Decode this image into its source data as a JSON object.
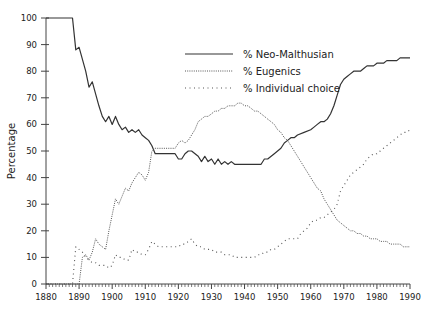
{
  "chart_data": {
    "type": "line",
    "title": "",
    "xlabel": "",
    "ylabel": "Percentage",
    "xlim": [
      1880,
      1990
    ],
    "ylim": [
      0,
      100
    ],
    "grid": false,
    "legend_position": "upper center",
    "x_ticks": [
      "1880",
      "1890",
      "1900",
      "1910",
      "1920",
      "1930",
      "1940",
      "1950",
      "1960",
      "1970",
      "1980",
      "1990"
    ],
    "y_ticks": [
      "0",
      "10",
      "20",
      "30",
      "40",
      "50",
      "60",
      "70",
      "80",
      "90",
      "100"
    ],
    "series": [
      {
        "name": "% Neo-Malthusian",
        "style": "solid",
        "points": [
          [
            1880,
            100
          ],
          [
            1888,
            100
          ],
          [
            1889,
            88
          ],
          [
            1890,
            89
          ],
          [
            1892,
            80
          ],
          [
            1893,
            74
          ],
          [
            1894,
            76
          ],
          [
            1896,
            67
          ],
          [
            1897,
            63
          ],
          [
            1898,
            61
          ],
          [
            1899,
            63
          ],
          [
            1900,
            60
          ],
          [
            1901,
            63
          ],
          [
            1902,
            60
          ],
          [
            1903,
            58
          ],
          [
            1904,
            59
          ],
          [
            1905,
            57
          ],
          [
            1906,
            58
          ],
          [
            1907,
            57
          ],
          [
            1908,
            58
          ],
          [
            1909,
            56
          ],
          [
            1910,
            55
          ],
          [
            1911,
            54
          ],
          [
            1912,
            52
          ],
          [
            1913,
            49
          ],
          [
            1914,
            49
          ],
          [
            1919,
            49
          ],
          [
            1920,
            47
          ],
          [
            1921,
            47
          ],
          [
            1922,
            49
          ],
          [
            1923,
            50
          ],
          [
            1924,
            50
          ],
          [
            1926,
            48
          ],
          [
            1927,
            46
          ],
          [
            1928,
            48
          ],
          [
            1929,
            46
          ],
          [
            1930,
            47
          ],
          [
            1931,
            45
          ],
          [
            1932,
            47
          ],
          [
            1933,
            45
          ],
          [
            1934,
            46
          ],
          [
            1935,
            45
          ],
          [
            1936,
            46
          ],
          [
            1937,
            45
          ],
          [
            1945,
            45
          ],
          [
            1946,
            47
          ],
          [
            1947,
            47
          ],
          [
            1949,
            49
          ],
          [
            1950,
            50
          ],
          [
            1951,
            51
          ],
          [
            1952,
            53
          ],
          [
            1953,
            54
          ],
          [
            1954,
            55
          ],
          [
            1955,
            55
          ],
          [
            1956,
            56
          ],
          [
            1958,
            57
          ],
          [
            1960,
            58
          ],
          [
            1961,
            59
          ],
          [
            1962,
            60
          ],
          [
            1963,
            61
          ],
          [
            1964,
            61
          ],
          [
            1965,
            62
          ],
          [
            1966,
            64
          ],
          [
            1967,
            67
          ],
          [
            1968,
            71
          ],
          [
            1969,
            75
          ],
          [
            1970,
            77
          ],
          [
            1971,
            78
          ],
          [
            1972,
            79
          ],
          [
            1973,
            80
          ],
          [
            1974,
            80
          ],
          [
            1975,
            80
          ],
          [
            1976,
            81
          ],
          [
            1977,
            82
          ],
          [
            1978,
            82
          ],
          [
            1979,
            82
          ],
          [
            1980,
            83
          ],
          [
            1982,
            83
          ],
          [
            1983,
            84
          ],
          [
            1984,
            84
          ],
          [
            1985,
            84
          ],
          [
            1986,
            84
          ],
          [
            1987,
            85
          ],
          [
            1989,
            85
          ],
          [
            1990,
            85
          ]
        ]
      },
      {
        "name": "% Eugenics",
        "style": "dense-dotted",
        "points": [
          [
            1880,
            0
          ],
          [
            1890,
            0
          ],
          [
            1891,
            10
          ],
          [
            1892,
            11
          ],
          [
            1893,
            9
          ],
          [
            1894,
            12
          ],
          [
            1895,
            17
          ],
          [
            1896,
            15
          ],
          [
            1897,
            14
          ],
          [
            1898,
            13
          ],
          [
            1899,
            20
          ],
          [
            1900,
            26
          ],
          [
            1901,
            32
          ],
          [
            1902,
            30
          ],
          [
            1903,
            33
          ],
          [
            1904,
            36
          ],
          [
            1905,
            35
          ],
          [
            1906,
            38
          ],
          [
            1907,
            40
          ],
          [
            1908,
            42
          ],
          [
            1909,
            41
          ],
          [
            1910,
            39
          ],
          [
            1911,
            42
          ],
          [
            1912,
            50
          ],
          [
            1913,
            51
          ],
          [
            1914,
            51
          ],
          [
            1919,
            51
          ],
          [
            1920,
            53
          ],
          [
            1921,
            54
          ],
          [
            1922,
            53
          ],
          [
            1923,
            54
          ],
          [
            1924,
            56
          ],
          [
            1925,
            58
          ],
          [
            1926,
            61
          ],
          [
            1927,
            62
          ],
          [
            1928,
            63
          ],
          [
            1929,
            63
          ],
          [
            1930,
            64
          ],
          [
            1931,
            65
          ],
          [
            1932,
            65
          ],
          [
            1933,
            66
          ],
          [
            1934,
            66
          ],
          [
            1935,
            67
          ],
          [
            1936,
            67
          ],
          [
            1937,
            67
          ],
          [
            1938,
            68
          ],
          [
            1939,
            68
          ],
          [
            1940,
            67
          ],
          [
            1941,
            67
          ],
          [
            1942,
            66
          ],
          [
            1943,
            65
          ],
          [
            1944,
            65
          ],
          [
            1945,
            64
          ],
          [
            1946,
            63
          ],
          [
            1947,
            62
          ],
          [
            1948,
            61
          ],
          [
            1949,
            60
          ],
          [
            1950,
            58
          ],
          [
            1951,
            57
          ],
          [
            1952,
            55
          ],
          [
            1953,
            54
          ],
          [
            1954,
            52
          ],
          [
            1955,
            50
          ],
          [
            1956,
            48
          ],
          [
            1957,
            46
          ],
          [
            1958,
            44
          ],
          [
            1959,
            42
          ],
          [
            1960,
            40
          ],
          [
            1961,
            38
          ],
          [
            1962,
            36
          ],
          [
            1963,
            35
          ],
          [
            1964,
            32
          ],
          [
            1965,
            30
          ],
          [
            1966,
            28
          ],
          [
            1967,
            26
          ],
          [
            1968,
            24
          ],
          [
            1969,
            23
          ],
          [
            1970,
            22
          ],
          [
            1971,
            21
          ],
          [
            1972,
            20
          ],
          [
            1973,
            20
          ],
          [
            1974,
            19
          ],
          [
            1975,
            19
          ],
          [
            1976,
            18
          ],
          [
            1977,
            18
          ],
          [
            1978,
            17
          ],
          [
            1979,
            17
          ],
          [
            1980,
            17
          ],
          [
            1981,
            16
          ],
          [
            1982,
            16
          ],
          [
            1983,
            16
          ],
          [
            1984,
            15
          ],
          [
            1985,
            15
          ],
          [
            1986,
            15
          ],
          [
            1987,
            15
          ],
          [
            1988,
            14
          ],
          [
            1989,
            14
          ],
          [
            1990,
            14
          ]
        ]
      },
      {
        "name": "% Individual choice",
        "style": "sparse-dotted",
        "points": [
          [
            1880,
            0
          ],
          [
            1888,
            0
          ],
          [
            1889,
            14
          ],
          [
            1890,
            13
          ],
          [
            1891,
            12
          ],
          [
            1892,
            10
          ],
          [
            1893,
            9
          ],
          [
            1894,
            8
          ],
          [
            1895,
            8
          ],
          [
            1896,
            7
          ],
          [
            1897,
            7
          ],
          [
            1898,
            7
          ],
          [
            1899,
            6
          ],
          [
            1900,
            7
          ],
          [
            1901,
            11
          ],
          [
            1902,
            10
          ],
          [
            1903,
            10
          ],
          [
            1904,
            9
          ],
          [
            1905,
            9
          ],
          [
            1906,
            13
          ],
          [
            1907,
            12
          ],
          [
            1908,
            12
          ],
          [
            1909,
            11
          ],
          [
            1910,
            11
          ],
          [
            1911,
            13
          ],
          [
            1912,
            16
          ],
          [
            1913,
            15
          ],
          [
            1914,
            14
          ],
          [
            1920,
            14
          ],
          [
            1921,
            15
          ],
          [
            1922,
            15
          ],
          [
            1923,
            16
          ],
          [
            1924,
            17
          ],
          [
            1925,
            15
          ],
          [
            1926,
            14
          ],
          [
            1927,
            14
          ],
          [
            1928,
            13
          ],
          [
            1929,
            13
          ],
          [
            1930,
            13
          ],
          [
            1931,
            12
          ],
          [
            1932,
            12
          ],
          [
            1933,
            12
          ],
          [
            1934,
            11
          ],
          [
            1935,
            11
          ],
          [
            1936,
            11
          ],
          [
            1937,
            10
          ],
          [
            1943,
            10
          ],
          [
            1944,
            11
          ],
          [
            1945,
            11
          ],
          [
            1946,
            12
          ],
          [
            1947,
            12
          ],
          [
            1948,
            13
          ],
          [
            1949,
            13
          ],
          [
            1950,
            14
          ],
          [
            1951,
            15
          ],
          [
            1952,
            16
          ],
          [
            1953,
            17
          ],
          [
            1954,
            17
          ],
          [
            1955,
            17
          ],
          [
            1956,
            17
          ],
          [
            1957,
            19
          ],
          [
            1958,
            20
          ],
          [
            1959,
            21
          ],
          [
            1960,
            23
          ],
          [
            1961,
            24
          ],
          [
            1962,
            24
          ],
          [
            1963,
            25
          ],
          [
            1964,
            25
          ],
          [
            1965,
            26
          ],
          [
            1966,
            27
          ],
          [
            1967,
            28
          ],
          [
            1968,
            30
          ],
          [
            1969,
            35
          ],
          [
            1970,
            37
          ],
          [
            1971,
            39
          ],
          [
            1972,
            41
          ],
          [
            1973,
            42
          ],
          [
            1974,
            43
          ],
          [
            1975,
            44
          ],
          [
            1976,
            45
          ],
          [
            1977,
            47
          ],
          [
            1978,
            48
          ],
          [
            1979,
            49
          ],
          [
            1980,
            49
          ],
          [
            1981,
            50
          ],
          [
            1982,
            51
          ],
          [
            1983,
            52
          ],
          [
            1984,
            53
          ],
          [
            1985,
            54
          ],
          [
            1986,
            55
          ],
          [
            1987,
            56
          ],
          [
            1988,
            57
          ],
          [
            1989,
            57
          ],
          [
            1990,
            58
          ]
        ]
      }
    ]
  },
  "legend": {
    "items": [
      {
        "label": "% Neo-Malthusian"
      },
      {
        "label": "% Eugenics"
      },
      {
        "label": "% Individual choice"
      }
    ]
  },
  "axes": {
    "ylabel": "Percentage"
  },
  "colors": {
    "line": "#333333",
    "axis": "#444444",
    "text": "#222222"
  }
}
